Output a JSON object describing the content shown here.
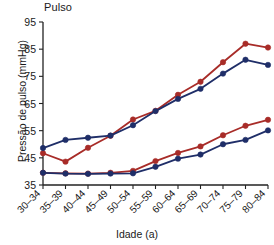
{
  "chart": {
    "title": "Pulso",
    "xlabel": "Idade (a)",
    "ylabel": "Pressão de pulso (mmHg)"
  },
  "chart_data": {
    "type": "line",
    "title": "Pulso",
    "xlabel": "Idade (a)",
    "ylabel": "Pressão de pulso (mmHg)",
    "categories": [
      "30–34",
      "35–39",
      "40–44",
      "45–49",
      "50–54",
      "55–59",
      "60–64",
      "65–69",
      "70–74",
      "75–79",
      "80–84"
    ],
    "ylim": [
      35,
      95
    ],
    "yticks": [
      35,
      45,
      55,
      65,
      75,
      85,
      95
    ],
    "grid": false,
    "legend_position": "right-inline",
    "annotations": [
      {
        "text": "4",
        "series": "group-4-red",
        "at_category": "80–84"
      },
      {
        "text": "1",
        "series": "group-1-red",
        "at_category": "80–84"
      }
    ],
    "series": [
      {
        "name": "group-4-red",
        "label": "4",
        "color": "#a82c28",
        "marker": "circle",
        "values": [
          46.7,
          43.6,
          48.7,
          53.1,
          59.1,
          62.3,
          68.2,
          73.0,
          80.2,
          87.0,
          85.6
        ]
      },
      {
        "name": "group-4-blue",
        "label": "4",
        "color": "#1f2e68",
        "marker": "circle",
        "values": [
          48.6,
          51.6,
          52.4,
          53.2,
          57.0,
          62.2,
          66.7,
          70.4,
          76.0,
          81.1,
          79.2
        ]
      },
      {
        "name": "group-1-red",
        "label": "1",
        "color": "#a82c28",
        "marker": "circle",
        "values": [
          39.5,
          39.3,
          39.2,
          39.5,
          40.2,
          43.8,
          46.8,
          49.2,
          53.3,
          56.8,
          59.0
        ]
      },
      {
        "name": "group-1-blue",
        "label": "1",
        "color": "#1f2e68",
        "marker": "circle",
        "values": [
          39.5,
          39.2,
          39.1,
          39.2,
          39.3,
          41.7,
          44.7,
          46.2,
          50.0,
          51.6,
          55.1
        ]
      }
    ]
  }
}
